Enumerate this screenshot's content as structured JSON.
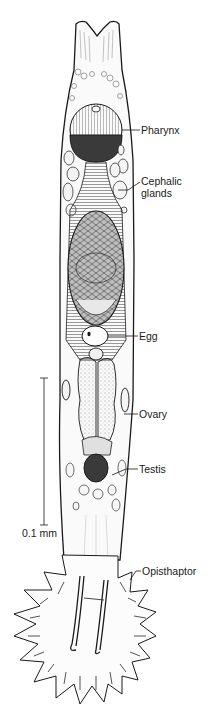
{
  "figure": {
    "labels": [
      {
        "id": "pharynx",
        "text": "Pharynx",
        "x": 141,
        "y": 124
      },
      {
        "id": "cephalic-glands",
        "text": "Cephalic\nglands",
        "x": 141,
        "y": 175
      },
      {
        "id": "egg",
        "text": "Egg",
        "x": 139,
        "y": 330
      },
      {
        "id": "ovary",
        "text": "Ovary",
        "x": 139,
        "y": 408
      },
      {
        "id": "testis",
        "text": "Testis",
        "x": 139,
        "y": 463
      },
      {
        "id": "opisthaptor",
        "text": "Opisthaptor",
        "x": 142,
        "y": 565
      }
    ],
    "scale_bar": {
      "label": "0.1 mm",
      "x": 44,
      "y_top": 378,
      "y_bottom": 525
    }
  },
  "colors": {
    "ink": "#1a1a1a",
    "stipple": "#8a8a8a",
    "dark_fill": "#3a3a3a",
    "paper": "#ffffff"
  }
}
